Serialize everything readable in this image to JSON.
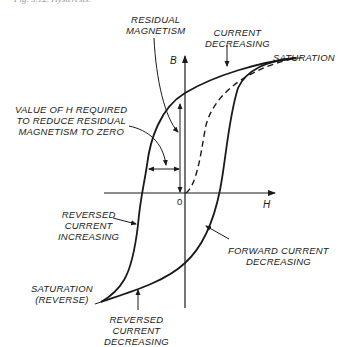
{
  "caption": "Fig. 5.12. Hysteresis.",
  "axes": {
    "y_label": "B",
    "x_label": "H",
    "origin_label": "0"
  },
  "labels": {
    "residual_magnetism": [
      "RESIDUAL",
      "MAGNETISM"
    ],
    "current_decreasing": [
      "CURRENT",
      "DECREASING"
    ],
    "saturation": "SATURATION",
    "value_of_h": [
      "VALUE OF H REQUIRED",
      "TO REDUCE RESIDUAL",
      "MAGNETISM TO ZERO"
    ],
    "reversed_current_increasing": [
      "REVERSED",
      "CURRENT",
      "INCREASING"
    ],
    "forward_current_decreasing": [
      "FORWARD CURRENT",
      "DECREASING"
    ],
    "saturation_reverse": [
      "SATURATION",
      "(REVERSE)"
    ],
    "reversed_current_decreasing": [
      "REVERSED",
      "CURRENT",
      "DECREASING"
    ]
  },
  "colors": {
    "ink": "#1a1a1a",
    "background": "#ffffff"
  }
}
